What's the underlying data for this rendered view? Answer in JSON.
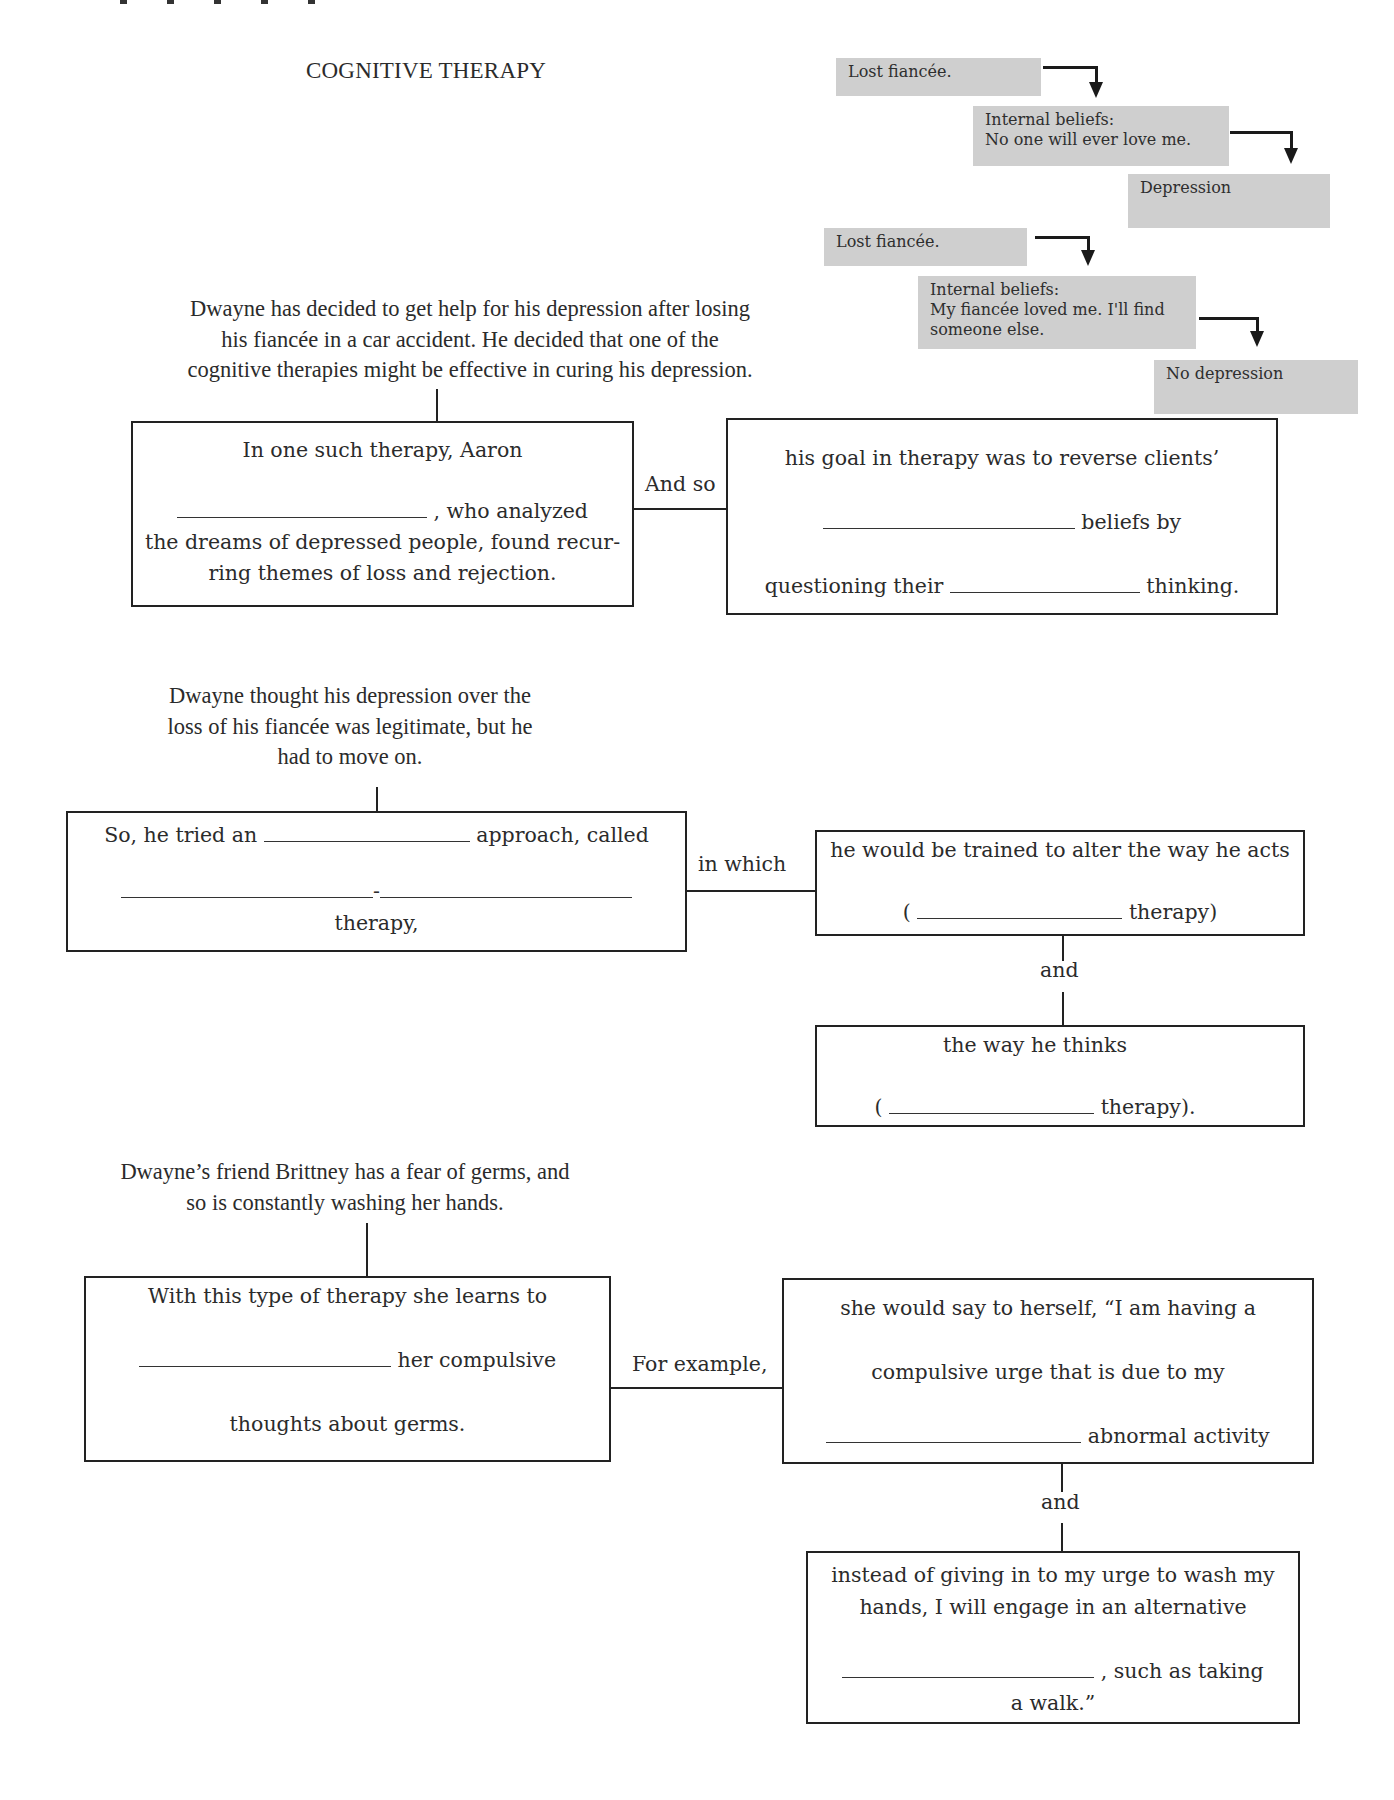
{
  "header": {
    "title": "COGNITIVE THERAPY"
  },
  "flow_examples": [
    {
      "event": "Lost fiancée.",
      "beliefs_label": "Internal beliefs:",
      "beliefs_text": "No one will ever love me.",
      "outcome": "Depression"
    },
    {
      "event": "Lost fiancée.",
      "beliefs_label": "Internal beliefs:",
      "beliefs_text_line1": "My fiancée loved me. I'll find",
      "beliefs_text_line2": "someone else.",
      "outcome": "No depression"
    }
  ],
  "section1": {
    "prompt_lines": [
      "Dwayne has decided to get help for his depression after losing",
      "his fiancée in a car accident. He decided that one of the",
      "cognitive therapies might be effective in curing his depression."
    ],
    "left_box": {
      "line1": "In one such therapy, Aaron",
      "line2_after_blank": ", who analyzed",
      "line3": "the dreams of depressed people, found recur-",
      "line4": "ring themes of loss and rejection."
    },
    "connector": "And so",
    "right_box": {
      "line1": "his goal in therapy was to reverse clients’",
      "line2_after_blank": "beliefs by",
      "line3_before_blank": "questioning their",
      "line3_after_blank": "thinking."
    }
  },
  "section2": {
    "prompt_lines": [
      "Dwayne thought his depression over the",
      "loss of his fiancée was legitimate, but he",
      "had to move on."
    ],
    "left_box": {
      "line1_before_blank": "So, he tried an",
      "line1_after_blank": "approach, called",
      "line2_separator": "-",
      "line3": "therapy,"
    },
    "connector": "in which",
    "right_box_top": {
      "line1": "he would be trained to alter the way he acts",
      "line2_open": "(",
      "line2_after_blank": "therapy)"
    },
    "and_label": "and",
    "right_box_bottom": {
      "line1": "the way he thinks",
      "line2_open": "(",
      "line2_after_blank": "therapy)."
    }
  },
  "section3": {
    "prompt_lines": [
      "Dwayne’s friend Brittney has a fear of germs, and",
      "so is constantly washing her hands."
    ],
    "left_box": {
      "line1": "With this type of therapy she learns to",
      "line2_after_blank": "her compulsive",
      "line3": "thoughts about germs."
    },
    "connector": "For example,",
    "right_box_top": {
      "line1": "she would say to herself, “I am having a",
      "line2": "compulsive urge that is due to my",
      "line3_after_blank": "abnormal activity"
    },
    "and_label": "and",
    "right_box_bottom": {
      "line1": "instead of giving in to my urge to wash my",
      "line2": "hands, I will engage in an alternative",
      "line3_after_blank": ", such as taking",
      "line4": "a walk.”"
    }
  }
}
